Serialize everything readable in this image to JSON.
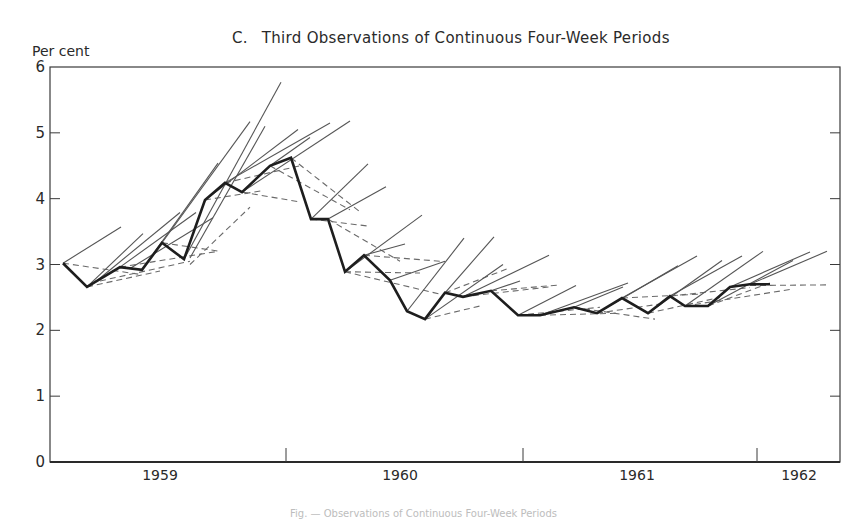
{
  "chart_data": {
    "type": "line",
    "panel_letter": "C.",
    "title_text": "Third Observations of Continuous Four-Week Periods",
    "ylabel": "Per cent",
    "xlabel": "",
    "ylim": [
      0,
      6
    ],
    "yticks": [
      0,
      1,
      2,
      3,
      4,
      5,
      6
    ],
    "xtick_labels": [
      "1959",
      "1960",
      "1961",
      "1962"
    ],
    "grid": false,
    "legend": null,
    "note": "Heavy line = observed series; thin solid lines = projected trends; dashed lines = earlier estimates/projections",
    "series": [
      {
        "name": "Observed (heavy line)",
        "style": "solid-heavy",
        "points": [
          {
            "xpx": 63,
            "y": 3.02
          },
          {
            "xpx": 87,
            "y": 2.66
          },
          {
            "xpx": 120,
            "y": 2.96
          },
          {
            "xpx": 142,
            "y": 2.92
          },
          {
            "xpx": 162,
            "y": 3.33
          },
          {
            "xpx": 184,
            "y": 3.08
          },
          {
            "xpx": 205,
            "y": 3.98
          },
          {
            "xpx": 225,
            "y": 4.24
          },
          {
            "xpx": 242,
            "y": 4.1
          },
          {
            "xpx": 270,
            "y": 4.5
          },
          {
            "xpx": 291,
            "y": 4.62
          },
          {
            "xpx": 311,
            "y": 3.69
          },
          {
            "xpx": 328,
            "y": 3.69
          },
          {
            "xpx": 345,
            "y": 2.89
          },
          {
            "xpx": 364,
            "y": 3.14
          },
          {
            "xpx": 390,
            "y": 2.76
          },
          {
            "xpx": 407,
            "y": 2.29
          },
          {
            "xpx": 425,
            "y": 2.17
          },
          {
            "xpx": 445,
            "y": 2.57
          },
          {
            "xpx": 463,
            "y": 2.51
          },
          {
            "xpx": 491,
            "y": 2.6
          },
          {
            "xpx": 518,
            "y": 2.23
          },
          {
            "xpx": 540,
            "y": 2.23
          },
          {
            "xpx": 574,
            "y": 2.35
          },
          {
            "xpx": 597,
            "y": 2.26
          },
          {
            "xpx": 622,
            "y": 2.49
          },
          {
            "xpx": 648,
            "y": 2.26
          },
          {
            "xpx": 670,
            "y": 2.52
          },
          {
            "xpx": 685,
            "y": 2.37
          },
          {
            "xpx": 708,
            "y": 2.37
          },
          {
            "xpx": 730,
            "y": 2.66
          },
          {
            "xpx": 750,
            "y": 2.7
          },
          {
            "xpx": 770,
            "y": 2.7
          }
        ]
      }
    ],
    "projection_lines": [
      {
        "x1": 63,
        "y1": 3.02,
        "x2": 121,
        "y2": 3.57
      },
      {
        "x1": 87,
        "y1": 2.66,
        "x2": 143,
        "y2": 3.47
      },
      {
        "x1": 95,
        "y1": 2.73,
        "x2": 180,
        "y2": 3.79
      },
      {
        "x1": 120,
        "y1": 2.96,
        "x2": 196,
        "y2": 3.79
      },
      {
        "x1": 130,
        "y1": 2.94,
        "x2": 213,
        "y2": 3.71
      },
      {
        "x1": 142,
        "y1": 2.92,
        "x2": 218,
        "y2": 4.54
      },
      {
        "x1": 162,
        "y1": 3.33,
        "x2": 250,
        "y2": 5.17
      },
      {
        "x1": 184,
        "y1": 3.08,
        "x2": 281,
        "y2": 5.77
      },
      {
        "x1": 190,
        "y1": 3.1,
        "x2": 265,
        "y2": 5.1
      },
      {
        "x1": 205,
        "y1": 3.98,
        "x2": 298,
        "y2": 5.05
      },
      {
        "x1": 225,
        "y1": 4.24,
        "x2": 330,
        "y2": 5.15
      },
      {
        "x1": 242,
        "y1": 4.1,
        "x2": 350,
        "y2": 5.18
      },
      {
        "x1": 270,
        "y1": 4.5,
        "x2": 310,
        "y2": 4.93
      },
      {
        "x1": 311,
        "y1": 3.69,
        "x2": 368,
        "y2": 4.53
      },
      {
        "x1": 328,
        "y1": 3.69,
        "x2": 386,
        "y2": 4.18
      },
      {
        "x1": 345,
        "y1": 2.89,
        "x2": 422,
        "y2": 3.75
      },
      {
        "x1": 364,
        "y1": 3.14,
        "x2": 405,
        "y2": 3.31
      },
      {
        "x1": 390,
        "y1": 2.76,
        "x2": 445,
        "y2": 3.05
      },
      {
        "x1": 407,
        "y1": 2.29,
        "x2": 464,
        "y2": 3.4
      },
      {
        "x1": 425,
        "y1": 2.17,
        "x2": 503,
        "y2": 3.0
      },
      {
        "x1": 445,
        "y1": 2.57,
        "x2": 494,
        "y2": 3.42
      },
      {
        "x1": 463,
        "y1": 2.51,
        "x2": 549,
        "y2": 3.14
      },
      {
        "x1": 491,
        "y1": 2.6,
        "x2": 520,
        "y2": 2.75
      },
      {
        "x1": 518,
        "y1": 2.23,
        "x2": 576,
        "y2": 2.68
      },
      {
        "x1": 540,
        "y1": 2.23,
        "x2": 628,
        "y2": 2.72
      },
      {
        "x1": 574,
        "y1": 2.35,
        "x2": 623,
        "y2": 2.66
      },
      {
        "x1": 597,
        "y1": 2.26,
        "x2": 678,
        "y2": 2.98
      },
      {
        "x1": 622,
        "y1": 2.49,
        "x2": 697,
        "y2": 3.13
      },
      {
        "x1": 648,
        "y1": 2.26,
        "x2": 722,
        "y2": 3.06
      },
      {
        "x1": 670,
        "y1": 2.52,
        "x2": 742,
        "y2": 3.13
      },
      {
        "x1": 685,
        "y1": 2.37,
        "x2": 763,
        "y2": 3.2
      },
      {
        "x1": 708,
        "y1": 2.37,
        "x2": 793,
        "y2": 3.06
      },
      {
        "x1": 730,
        "y1": 2.66,
        "x2": 810,
        "y2": 3.19
      },
      {
        "x1": 750,
        "y1": 2.7,
        "x2": 827,
        "y2": 3.2
      }
    ],
    "dashed_lines": [
      {
        "x1": 63,
        "y1": 3.02,
        "x2": 140,
        "y2": 2.85
      },
      {
        "x1": 87,
        "y1": 2.66,
        "x2": 160,
        "y2": 2.9
      },
      {
        "x1": 100,
        "y1": 2.75,
        "x2": 190,
        "y2": 3.05
      },
      {
        "x1": 120,
        "y1": 2.96,
        "x2": 218,
        "y2": 3.2
      },
      {
        "x1": 162,
        "y1": 3.33,
        "x2": 220,
        "y2": 3.2
      },
      {
        "x1": 190,
        "y1": 3.0,
        "x2": 250,
        "y2": 3.87
      },
      {
        "x1": 205,
        "y1": 3.98,
        "x2": 262,
        "y2": 4.12
      },
      {
        "x1": 225,
        "y1": 4.24,
        "x2": 300,
        "y2": 4.5
      },
      {
        "x1": 242,
        "y1": 4.1,
        "x2": 300,
        "y2": 3.95
      },
      {
        "x1": 270,
        "y1": 4.5,
        "x2": 350,
        "y2": 3.83
      },
      {
        "x1": 291,
        "y1": 4.62,
        "x2": 360,
        "y2": 3.8
      },
      {
        "x1": 311,
        "y1": 3.69,
        "x2": 370,
        "y2": 3.58
      },
      {
        "x1": 328,
        "y1": 3.69,
        "x2": 400,
        "y2": 3.05
      },
      {
        "x1": 345,
        "y1": 2.89,
        "x2": 420,
        "y2": 2.87
      },
      {
        "x1": 364,
        "y1": 3.14,
        "x2": 440,
        "y2": 3.05
      },
      {
        "x1": 345,
        "y1": 2.89,
        "x2": 440,
        "y2": 2.55
      },
      {
        "x1": 425,
        "y1": 2.17,
        "x2": 480,
        "y2": 2.37
      },
      {
        "x1": 445,
        "y1": 2.57,
        "x2": 510,
        "y2": 2.95
      },
      {
        "x1": 463,
        "y1": 2.51,
        "x2": 550,
        "y2": 2.66
      },
      {
        "x1": 491,
        "y1": 2.6,
        "x2": 560,
        "y2": 2.69
      },
      {
        "x1": 518,
        "y1": 2.23,
        "x2": 600,
        "y2": 2.35
      },
      {
        "x1": 540,
        "y1": 2.23,
        "x2": 620,
        "y2": 2.26
      },
      {
        "x1": 574,
        "y1": 2.35,
        "x2": 655,
        "y2": 2.17
      },
      {
        "x1": 597,
        "y1": 2.26,
        "x2": 660,
        "y2": 2.4
      },
      {
        "x1": 622,
        "y1": 2.49,
        "x2": 700,
        "y2": 2.55
      },
      {
        "x1": 648,
        "y1": 2.26,
        "x2": 720,
        "y2": 2.5
      },
      {
        "x1": 670,
        "y1": 2.52,
        "x2": 750,
        "y2": 2.65
      },
      {
        "x1": 685,
        "y1": 2.37,
        "x2": 790,
        "y2": 2.62
      },
      {
        "x1": 708,
        "y1": 2.37,
        "x2": 770,
        "y2": 2.72
      },
      {
        "x1": 740,
        "y1": 2.68,
        "x2": 828,
        "y2": 2.69
      }
    ]
  },
  "axes": {
    "plot_left_px": 50,
    "plot_right_px": 840,
    "plot_top_px": 67,
    "plot_bottom_px": 462,
    "year_boundaries_px": [
      286,
      523,
      757
    ],
    "xtick_label_px": [
      160,
      400,
      637,
      799
    ]
  },
  "caption_partial": "Fig. — Observations of Continuous Four-Week Periods"
}
